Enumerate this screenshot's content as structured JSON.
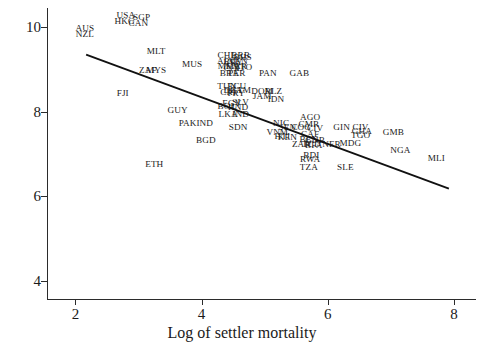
{
  "chart_data": {
    "type": "scatter",
    "title": "",
    "xlabel": "Log of settler mortality",
    "ylabel": "Log GDP per capita, PPP, 1995",
    "xlim": [
      1.55,
      8.35
    ],
    "ylim": [
      3.55,
      10.45
    ],
    "xticks": [
      2,
      4,
      6,
      8
    ],
    "yticks": [
      4,
      6,
      8,
      10
    ],
    "grid": false,
    "legend": null,
    "marker_style": "country-code-text",
    "fit_line": {
      "label": "regression line",
      "x": [
        2.17,
        7.92
      ],
      "y": [
        9.35,
        6.18
      ]
    },
    "points": [
      {
        "label": "AUS",
        "x": 2.15,
        "y": 9.95
      },
      {
        "label": "NZL",
        "x": 2.15,
        "y": 9.82
      },
      {
        "label": "USA",
        "x": 2.8,
        "y": 10.25
      },
      {
        "label": "SGP",
        "x": 3.05,
        "y": 10.22
      },
      {
        "label": "HKG",
        "x": 2.78,
        "y": 10.12
      },
      {
        "label": "CAN",
        "x": 3.0,
        "y": 10.08
      },
      {
        "label": "MLT",
        "x": 3.28,
        "y": 9.42
      },
      {
        "label": "MUS",
        "x": 3.85,
        "y": 9.1
      },
      {
        "label": "ZAF",
        "x": 3.15,
        "y": 8.95
      },
      {
        "label": "MYS",
        "x": 3.28,
        "y": 8.95
      },
      {
        "label": "FJI",
        "x": 2.75,
        "y": 8.42
      },
      {
        "label": "GUY",
        "x": 3.62,
        "y": 8.02
      },
      {
        "label": "PAK",
        "x": 3.78,
        "y": 7.7
      },
      {
        "label": "IND",
        "x": 4.05,
        "y": 7.7
      },
      {
        "label": "BGD",
        "x": 4.07,
        "y": 7.3
      },
      {
        "label": "ETH",
        "x": 3.25,
        "y": 6.75
      },
      {
        "label": "CHL",
        "x": 4.4,
        "y": 9.32
      },
      {
        "label": "BRB",
        "x": 4.62,
        "y": 9.32
      },
      {
        "label": "BHS",
        "x": 4.65,
        "y": 9.28
      },
      {
        "label": "ARG",
        "x": 4.4,
        "y": 9.18
      },
      {
        "label": "VEN",
        "x": 4.58,
        "y": 9.18
      },
      {
        "label": "URY",
        "x": 4.5,
        "y": 9.14
      },
      {
        "label": "MEX",
        "x": 4.42,
        "y": 9.05
      },
      {
        "label": "MAR",
        "x": 4.55,
        "y": 9.05
      },
      {
        "label": "TTO",
        "x": 4.66,
        "y": 9.03
      },
      {
        "label": "COL",
        "x": 4.5,
        "y": 9.0
      },
      {
        "label": "BRA",
        "x": 4.44,
        "y": 8.88
      },
      {
        "label": "PER",
        "x": 4.56,
        "y": 8.88
      },
      {
        "label": "PAN",
        "x": 5.05,
        "y": 8.88
      },
      {
        "label": "GAB",
        "x": 5.55,
        "y": 8.88
      },
      {
        "label": "TUN",
        "x": 4.4,
        "y": 8.58
      },
      {
        "label": "ECU",
        "x": 4.56,
        "y": 8.58
      },
      {
        "label": "DZA",
        "x": 4.5,
        "y": 8.5
      },
      {
        "label": "GTM",
        "x": 4.62,
        "y": 8.5
      },
      {
        "label": "CRI",
        "x": 4.42,
        "y": 8.44
      },
      {
        "label": "PRY",
        "x": 4.55,
        "y": 8.42
      },
      {
        "label": "DOM",
        "x": 4.96,
        "y": 8.46
      },
      {
        "label": "BLZ",
        "x": 5.14,
        "y": 8.46
      },
      {
        "label": "JAM",
        "x": 4.96,
        "y": 8.34
      },
      {
        "label": "IDN",
        "x": 5.18,
        "y": 8.28
      },
      {
        "label": "SLV",
        "x": 4.62,
        "y": 8.2
      },
      {
        "label": "EGY",
        "x": 4.48,
        "y": 8.18
      },
      {
        "label": "BOL",
        "x": 4.4,
        "y": 8.1
      },
      {
        "label": "HND",
        "x": 4.58,
        "y": 8.08
      },
      {
        "label": "LKA",
        "x": 4.42,
        "y": 7.92
      },
      {
        "label": "IND2",
        "x": 4.62,
        "y": 7.92
      },
      {
        "label": "SDN",
        "x": 4.58,
        "y": 7.62
      },
      {
        "label": "NIC",
        "x": 5.26,
        "y": 7.72
      },
      {
        "label": "SEN",
        "x": 5.36,
        "y": 7.62
      },
      {
        "label": "VNM",
        "x": 5.2,
        "y": 7.5
      },
      {
        "label": "HTI",
        "x": 5.28,
        "y": 7.4
      },
      {
        "label": "KEN",
        "x": 5.36,
        "y": 7.38
      },
      {
        "label": "AGO",
        "x": 5.72,
        "y": 7.84
      },
      {
        "label": "CMR",
        "x": 5.7,
        "y": 7.68
      },
      {
        "label": "COG",
        "x": 5.58,
        "y": 7.62
      },
      {
        "label": "CIV2",
        "x": 5.8,
        "y": 7.6
      },
      {
        "label": "CAF",
        "x": 5.72,
        "y": 7.44
      },
      {
        "label": "BEN",
        "x": 5.7,
        "y": 7.32
      },
      {
        "label": "GNB",
        "x": 5.8,
        "y": 7.3
      },
      {
        "label": "ZAR",
        "x": 5.58,
        "y": 7.22
      },
      {
        "label": "TCD",
        "x": 5.74,
        "y": 7.22
      },
      {
        "label": "BFA",
        "x": 5.78,
        "y": 7.18
      },
      {
        "label": "BDI",
        "x": 5.74,
        "y": 6.96
      },
      {
        "label": "RWA",
        "x": 5.72,
        "y": 6.86
      },
      {
        "label": "TZA",
        "x": 5.7,
        "y": 6.68
      },
      {
        "label": "GIN",
        "x": 6.22,
        "y": 7.62
      },
      {
        "label": "CIV",
        "x": 6.52,
        "y": 7.62
      },
      {
        "label": "GHA",
        "x": 6.54,
        "y": 7.52
      },
      {
        "label": "TGO",
        "x": 6.52,
        "y": 7.42
      },
      {
        "label": "GMB",
        "x": 7.04,
        "y": 7.5
      },
      {
        "label": "NER",
        "x": 6.06,
        "y": 7.22
      },
      {
        "label": "MDG",
        "x": 6.36,
        "y": 7.24
      },
      {
        "label": "NGA",
        "x": 7.15,
        "y": 7.06
      },
      {
        "label": "MLI",
        "x": 7.72,
        "y": 6.88
      },
      {
        "label": "SLE",
        "x": 6.28,
        "y": 6.68
      }
    ]
  }
}
